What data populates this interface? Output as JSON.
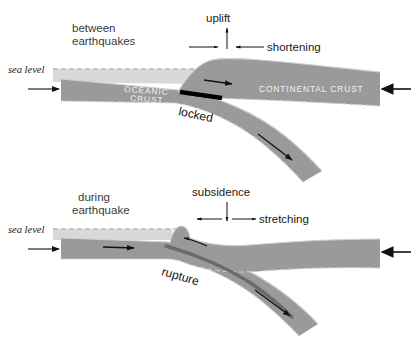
{
  "figure": {
    "colors": {
      "crust_fill": "#9a9a9a",
      "crust_fill_light": "#a8a8a8",
      "water_fill": "#d8d8d8",
      "locked_zone": "#000000",
      "rupture_line": "#5a5a5a",
      "outline_dash": "#cfcfcf",
      "text_dark": "#1a1a1a",
      "text_light": "#f2f2f2",
      "background": "#ffffff"
    }
  },
  "panels": [
    {
      "id": "between-earthquakes",
      "phase_label_line1": "between",
      "phase_label_line2": "earthquakes",
      "sea_level_label": "sea level",
      "vertical_motion_label": "uplift",
      "horizontal_motion_label": "shortening",
      "oceanic_label_line1": "OCEANIC",
      "oceanic_label_line2": "CRUST",
      "continental_label": "CONTINENTAL CRUST",
      "fault_state_label": "locked",
      "left_arrow_name": "oceanic-plate-convergence-arrow",
      "right_arrow_name": "continental-plate-convergence-arrow",
      "slab_arrow_name": "subducting-slab-motion-arrow",
      "overriding_arrow_name": "overriding-plate-motion-arrow"
    },
    {
      "id": "during-earthquake",
      "phase_label_line1": "during",
      "phase_label_line2": "earthquake",
      "sea_level_label": "sea level",
      "vertical_motion_label": "subsidence",
      "horizontal_motion_label": "stretching",
      "fault_state_label": "rupture",
      "left_arrow_name": "oceanic-plate-convergence-arrow",
      "right_arrow_name": "continental-plate-convergence-arrow",
      "slab_arrow_name": "subducting-slab-motion-arrow",
      "overriding_arrow_name": "overriding-plate-rebound-arrow"
    }
  ]
}
